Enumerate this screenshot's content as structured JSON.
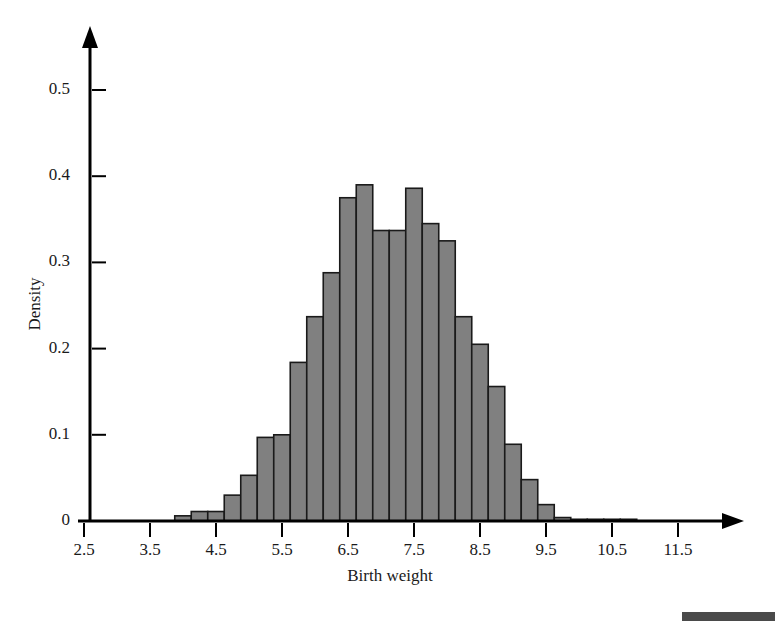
{
  "chart_data": {
    "type": "bar",
    "title": "",
    "xlabel": "Birth weight",
    "ylabel": "Density",
    "xlim": [
      2.5,
      12.0
    ],
    "ylim": [
      0,
      0.55
    ],
    "grid": false,
    "legend": null,
    "bin_width": 0.25,
    "bar_color": "#808080",
    "bar_edge_color": "#1a1a1a",
    "axis_color": "#000000",
    "xticks": [
      "2.5",
      "3.5",
      "4.5",
      "5.5",
      "6.5",
      "7.5",
      "8.5",
      "9.5",
      "10.5",
      "11.5"
    ],
    "xtick_values": [
      2.5,
      3.5,
      4.5,
      5.5,
      6.5,
      7.5,
      8.5,
      9.5,
      10.5,
      11.5
    ],
    "yticks": [
      "0",
      "0.1",
      "0.2",
      "0.3",
      "0.4",
      "0.5"
    ],
    "ytick_values": [
      0,
      0.1,
      0.2,
      0.3,
      0.4,
      0.5
    ],
    "bin_starts": [
      3.875,
      4.125,
      4.375,
      4.625,
      4.875,
      5.125,
      5.375,
      5.625,
      5.875,
      6.125,
      6.375,
      6.625,
      6.875,
      7.125,
      7.375,
      7.625,
      7.875,
      8.125,
      8.375,
      8.625,
      8.875,
      9.125,
      9.375,
      9.625,
      9.875,
      10.125,
      10.375,
      10.625,
      10.875
    ],
    "values": [
      0.006,
      0.011,
      0.011,
      0.03,
      0.053,
      0.097,
      0.1,
      0.184,
      0.237,
      0.288,
      0.375,
      0.39,
      0.337,
      0.337,
      0.386,
      0.345,
      0.325,
      0.237,
      0.205,
      0.156,
      0.089,
      0.048,
      0.019,
      0.004,
      0.002,
      0.002,
      0.002,
      0.002,
      0.0
    ],
    "footer_swatch_color": "#4a4a4a"
  }
}
